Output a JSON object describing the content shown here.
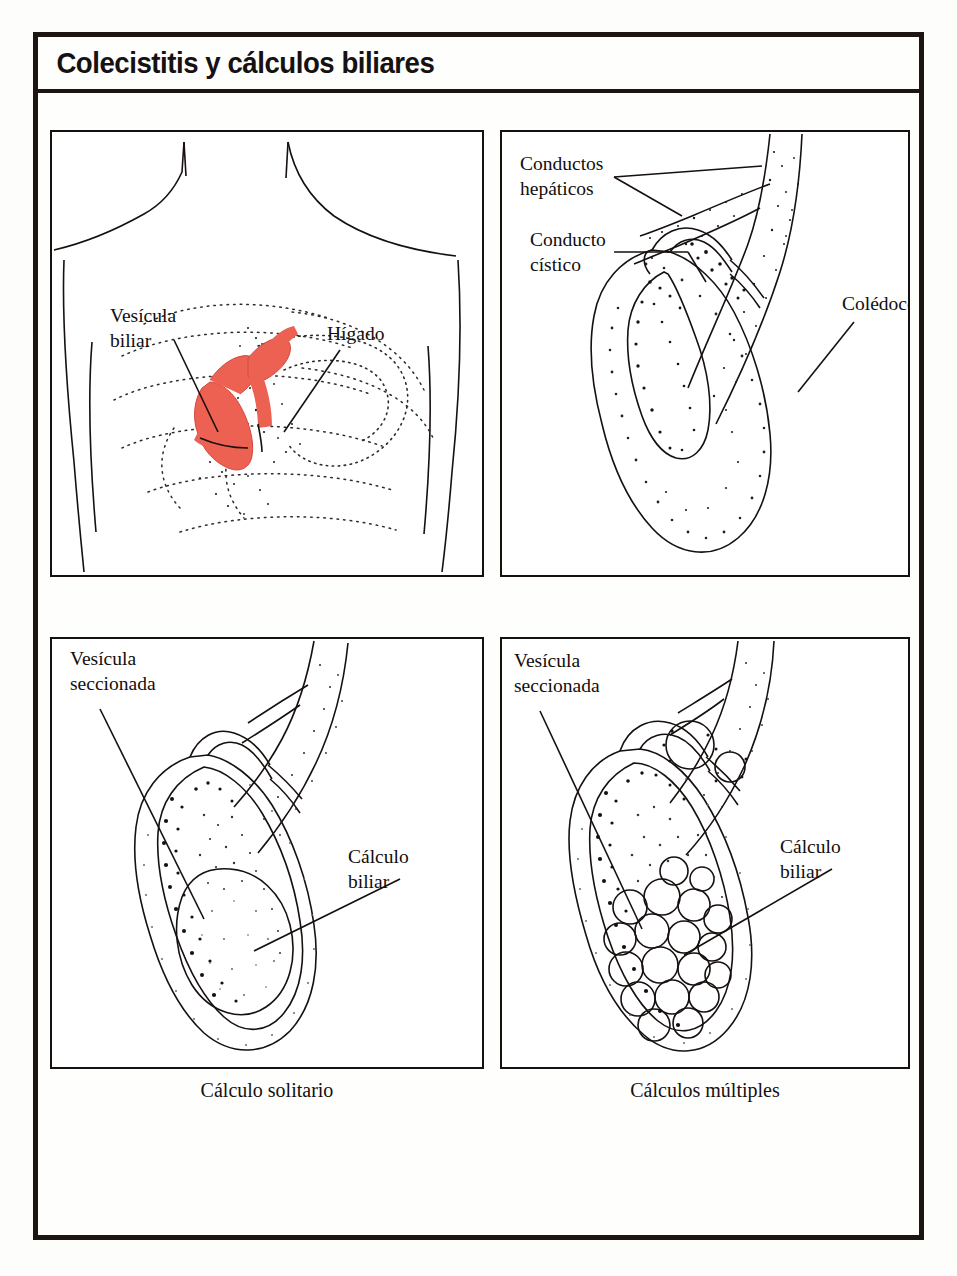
{
  "header": {
    "title": "Colecistitis y cálculos biliares"
  },
  "panels": {
    "top_left": {
      "name": "torso-anatomy",
      "labels": [
        {
          "id": "gallbladder",
          "text": "Vesícula\nbiliar"
        },
        {
          "id": "liver",
          "text": "Hígado"
        }
      ]
    },
    "top_right": {
      "name": "biliary-ducts",
      "labels": [
        {
          "id": "hepatic-ducts",
          "text": "Conductos\nhepáticos"
        },
        {
          "id": "cystic-duct",
          "text": "Conducto\ncístico"
        },
        {
          "id": "common-bile-duct",
          "text": "Colédoco"
        }
      ]
    },
    "bottom_left": {
      "name": "single-stone",
      "caption": "Cálculo solitario",
      "labels": [
        {
          "id": "sectioned-gallbladder",
          "text": "Vesícula\nseccionada"
        },
        {
          "id": "gallstone",
          "text": "Cálculo\nbiliar"
        }
      ]
    },
    "bottom_right": {
      "name": "multiple-stones",
      "caption": "Cálculos múltiples",
      "labels": [
        {
          "id": "sectioned-gallbladder",
          "text": "Vesícula\nseccionada"
        },
        {
          "id": "gallstone",
          "text": "Cálculo\nbiliar"
        }
      ]
    }
  },
  "colors": {
    "ink": "#16100e",
    "paper": "#fdfdfb",
    "gallbladder_highlight": "#ec6152",
    "stipple": "#1a1a1a"
  }
}
